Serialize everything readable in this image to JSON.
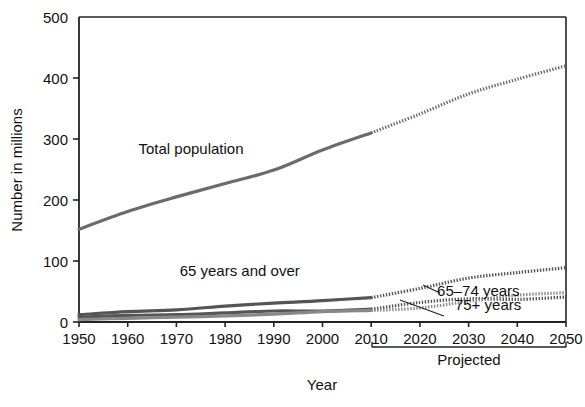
{
  "chart_data": {
    "type": "line",
    "title": "",
    "xlabel": "Year",
    "ylabel": "Number in millions",
    "xlim": [
      1950,
      2050
    ],
    "ylim": [
      0,
      500
    ],
    "yticks": [
      0,
      100,
      200,
      300,
      400,
      500
    ],
    "ytick_labels": [
      "0",
      "100",
      "200",
      "300",
      "400",
      "500"
    ],
    "xticks": [
      1950,
      1960,
      1970,
      1980,
      1990,
      2000,
      2010,
      2020,
      2030,
      2040,
      2050
    ],
    "xtick_labels": [
      "1950",
      "1960",
      "1970",
      "1980",
      "1990",
      "2000",
      "2010",
      "2020",
      "2030",
      "2040",
      "2050"
    ],
    "grid": false,
    "legend_position": "inline-annotations",
    "projection_start_year": 2010,
    "projection_bracket_label": "Projected",
    "x": [
      1950,
      1960,
      1970,
      1980,
      1990,
      2000,
      2010,
      2020,
      2030,
      2040,
      2050
    ],
    "series": [
      {
        "name": "Total population",
        "label": "Total population",
        "values": [
          152,
          181,
          205,
          227,
          249,
          282,
          310,
          341,
          374,
          398,
          420
        ],
        "color": "#6b6b6b"
      },
      {
        "name": "65 years and over",
        "label": "65 years and over",
        "values": [
          12,
          17,
          20,
          26,
          31,
          35,
          40,
          55,
          72,
          81,
          89
        ],
        "color": "#555555"
      },
      {
        "name": "65-74 years",
        "label": "65–74 years",
        "values": [
          8,
          11,
          12,
          15,
          18,
          18,
          21,
          32,
          38,
          37,
          41
        ],
        "color": "#555555"
      },
      {
        "name": "75+ years",
        "label": "75+ years",
        "values": [
          4,
          6,
          8,
          10,
          13,
          17,
          19,
          23,
          34,
          44,
          48
        ],
        "color": "#888888"
      }
    ],
    "annotations": [
      {
        "text": "Total population",
        "x": 1973,
        "y": 275
      },
      {
        "text": "65 years and over",
        "x": 1983,
        "y": 75
      },
      {
        "text": "65–74 years",
        "x": 2032,
        "y": 43
      },
      {
        "text": "75+ years",
        "x": 2034,
        "y": 20
      }
    ]
  },
  "axes": {
    "ylabel": "Number in millions",
    "xlabel": "Year"
  },
  "projected": {
    "label": "Projected"
  }
}
